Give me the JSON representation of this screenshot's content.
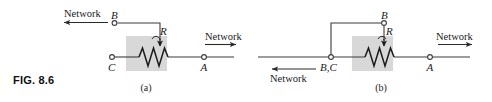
{
  "figure": {
    "number_label": "FIG. 8.6",
    "background_color": "#ffffff",
    "wire_color": "#3b3b3b",
    "shade_color": "#c9c9c9"
  },
  "panel_a": {
    "caption": "(a)",
    "network_left_label": "Network",
    "network_right_label": "Network",
    "terminal_b": "B",
    "terminal_c": "C",
    "terminal_a": "A",
    "resistor_label": "R",
    "left_arrow_direction": "left",
    "right_arrow_direction": "right"
  },
  "panel_b": {
    "caption": "(b)",
    "network_left_label": "Network",
    "network_right_label": "Network",
    "terminal_b": "B",
    "terminal_bc": "B,C",
    "terminal_a": "A",
    "resistor_label": "R",
    "left_arrow_direction": "left",
    "right_arrow_direction": "right"
  }
}
